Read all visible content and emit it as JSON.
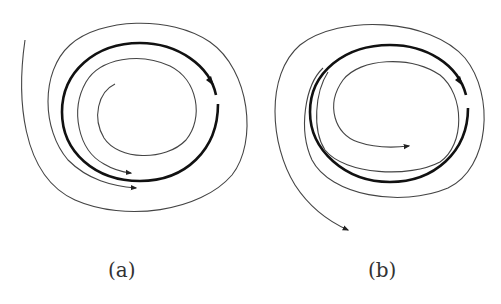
{
  "figure": {
    "panels": [
      {
        "label": "(a)",
        "description": "Stable limit cycle: outer and inner trajectories spiral toward the closed orbit",
        "limit_cycle_direction": "counterclockwise",
        "trajectories": [
          "outer trajectory spiraling inward",
          "inner trajectory spiraling outward"
        ]
      },
      {
        "label": "(b)",
        "description": "Unstable limit cycle: nearby trajectories spiral away from the closed orbit",
        "limit_cycle_direction": "counterclockwise",
        "trajectories": [
          "outer trajectory spiraling outward",
          "inner trajectory spiraling inward"
        ]
      }
    ],
    "colors": {
      "stroke": "#222222",
      "thin_stroke": "#444444",
      "background": "#ffffff"
    }
  }
}
